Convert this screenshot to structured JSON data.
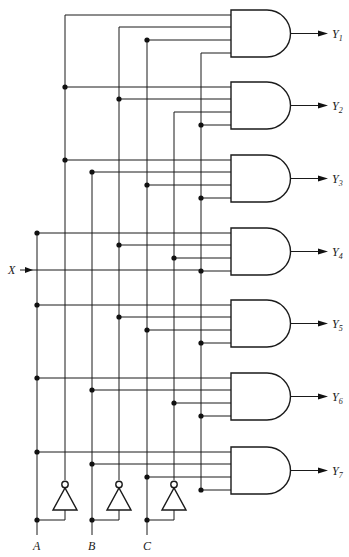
{
  "colors": {
    "line": "#1a1a1a",
    "background": "#ffffff"
  },
  "inputs": {
    "data_label": "X",
    "select_labels": [
      "A",
      "B",
      "C"
    ]
  },
  "columns": {
    "A": 37,
    "A_not": 65,
    "B": 92,
    "B_not": 119,
    "C": 147,
    "C_not": 174,
    "X": 201
  },
  "gates": [
    {
      "output": "Y",
      "sub": "1",
      "top": 10,
      "inputs": [
        "A_not",
        "B_not",
        "C",
        "X"
      ]
    },
    {
      "output": "Y",
      "sub": "2",
      "top": 82,
      "inputs": [
        "A_not",
        "B_not",
        "C_not",
        "X"
      ]
    },
    {
      "output": "Y",
      "sub": "3",
      "top": 155,
      "inputs": [
        "A_not",
        "B",
        "C",
        "X"
      ]
    },
    {
      "output": "Y",
      "sub": "4",
      "top": 228,
      "inputs": [
        "A",
        "B_not",
        "C_not",
        "X"
      ]
    },
    {
      "output": "Y",
      "sub": "5",
      "top": 300,
      "inputs": [
        "A",
        "B_not",
        "C",
        "X"
      ]
    },
    {
      "output": "Y",
      "sub": "6",
      "top": 373,
      "inputs": [
        "A",
        "B",
        "C_not",
        "X"
      ]
    },
    {
      "output": "Y",
      "sub": "7",
      "top": 447,
      "inputs": [
        "A",
        "B",
        "C",
        "X"
      ]
    }
  ]
}
